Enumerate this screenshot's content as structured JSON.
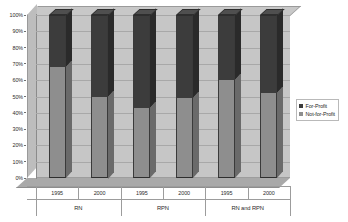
{
  "chart_data": {
    "type": "bar",
    "subtype": "stacked-column-100-percent-3d",
    "title": "",
    "xlabel": "",
    "ylabel": "",
    "ylim": [
      0,
      100
    ],
    "y_tick_labels": [
      "100%",
      "90%",
      "80%",
      "70%",
      "60%",
      "50%",
      "40%",
      "30%",
      "20%",
      "10%",
      "0%"
    ],
    "y_tick_values": [
      100,
      90,
      80,
      70,
      60,
      50,
      40,
      30,
      20,
      10,
      0
    ],
    "grid": true,
    "legend_position": "right",
    "groups": [
      {
        "label": "RN",
        "categories": [
          "1995",
          "2000"
        ]
      },
      {
        "label": "RPN",
        "categories": [
          "1995",
          "2000"
        ]
      },
      {
        "label": "RN and RPN",
        "categories": [
          "1995",
          "2000"
        ]
      }
    ],
    "categories": [
      "1995",
      "2000",
      "1995",
      "2000",
      "1995",
      "2000"
    ],
    "series": [
      {
        "name": "Not-for-Profit",
        "color": "#8e8e8e",
        "values": [
          68,
          50,
          43,
          49,
          60,
          52
        ]
      },
      {
        "name": "For-Profit",
        "color": "#3c3c3c",
        "values": [
          32,
          50,
          57,
          51,
          40,
          48
        ]
      }
    ]
  },
  "legend": {
    "items": [
      {
        "label": "For-Profit",
        "swatch": "profit"
      },
      {
        "label": "Not-for-Profit",
        "swatch": "nonprofit"
      }
    ]
  },
  "colors": {
    "for_profit": "#3c3c3c",
    "not_for_profit": "#8e8e8e",
    "plot_background": "#c6c6c6",
    "gridline": "#a8a8a8",
    "axis_text": "#2b2b2b"
  }
}
